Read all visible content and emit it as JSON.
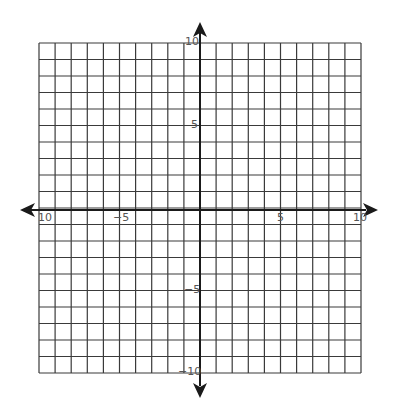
{
  "chart_data": {
    "type": "scatter",
    "title": "",
    "xlabel": "",
    "ylabel": "",
    "xlim": [
      -10,
      10
    ],
    "ylim": [
      -10,
      10
    ],
    "grid": true,
    "grid_step": 1,
    "series": [],
    "x_tick_labels": [
      "-10",
      "-5",
      "5",
      "10"
    ],
    "y_tick_labels": [
      "10",
      "5",
      "-5",
      "-10"
    ],
    "axis_arrows": true
  },
  "labels": {
    "x_neg10": "10",
    "x_neg5": "−5",
    "x_pos5": "5",
    "x_pos10": "10",
    "y_pos10": "10",
    "y_pos5": "5",
    "y_neg5": "−5",
    "y_neg10": "−10"
  },
  "colors": {
    "grid": "#3a3a3a",
    "axis": "#1a1a1a",
    "label": "#555555"
  }
}
